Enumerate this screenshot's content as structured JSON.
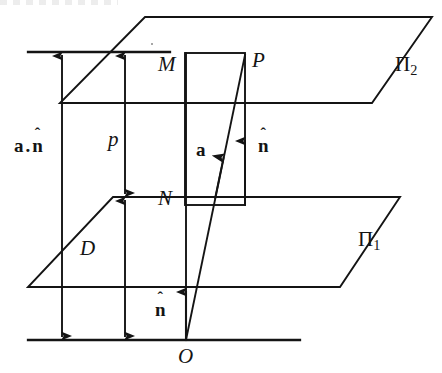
{
  "figure": {
    "type": "geometry-diagram",
    "width": 442,
    "height": 373,
    "background_color": "#ffffff",
    "stroke_color": "#141414"
  },
  "labels": {
    "upper_plane": "Π",
    "upper_plane_sub": "2",
    "lower_plane": "Π",
    "lower_plane_sub": "1",
    "point_m": "M",
    "point_p": "P",
    "point_n": "N",
    "origin": "O",
    "distance_d": "D",
    "distance_p": "p",
    "vector_a": "a",
    "normal_n": "n",
    "normal_hat": "ˆ",
    "dot_product_a": "a",
    "dot_product_sep": ".",
    "dot_product_n": "n"
  },
  "geometry": {
    "upper_plane_vertices": "145,17 432,17 372,103 60,103",
    "lower_plane_vertices": "113,197 400,197 340,287 28,287",
    "top_reference_line": {
      "x1": 28,
      "y1": 52,
      "x2": 170,
      "y2": 52
    },
    "bottom_reference_line": {
      "x1": 28,
      "y1": 340,
      "x2": 300,
      "y2": 340
    },
    "rect_mnp": {
      "x": 185,
      "y": 53,
      "width": 60,
      "height": 152
    },
    "vector_a_line": {
      "x1": 186,
      "y1": 340,
      "x2": 245,
      "y2": 55
    },
    "vertical_om": {
      "x1": 186,
      "y1": 340,
      "x2": 186,
      "y2": 53
    },
    "arrow_adotn": {
      "x": 62,
      "y_top": 52,
      "y_bottom": 340
    },
    "arrow_p": {
      "x": 125,
      "y_top": 52,
      "y_bottom": 197
    },
    "arrow_D": {
      "x": 125,
      "y_top": 197,
      "y_bottom": 340
    },
    "arrow_nhat_middle": {
      "x": 245,
      "y_top": 140,
      "y_bottom": 205
    },
    "arrow_nhat_bottom": {
      "x": 186,
      "y_top": 290,
      "y_bottom": 340
    }
  },
  "label_positions": {
    "adotn": {
      "left": 14,
      "top": 136
    },
    "p": {
      "left": 108,
      "top": 129
    },
    "D": {
      "left": 80,
      "top": 238
    },
    "M": {
      "left": 158,
      "top": 54
    },
    "P": {
      "left": 252,
      "top": 50
    },
    "N": {
      "left": 158,
      "top": 188
    },
    "a": {
      "left": 196,
      "top": 140
    },
    "nhat_mid": {
      "left": 258,
      "top": 136
    },
    "nhat_bottom": {
      "left": 155,
      "top": 300
    },
    "pi2": {
      "left": 395,
      "top": 54
    },
    "pi1": {
      "left": 358,
      "top": 229
    },
    "O": {
      "left": 178,
      "top": 346
    }
  }
}
